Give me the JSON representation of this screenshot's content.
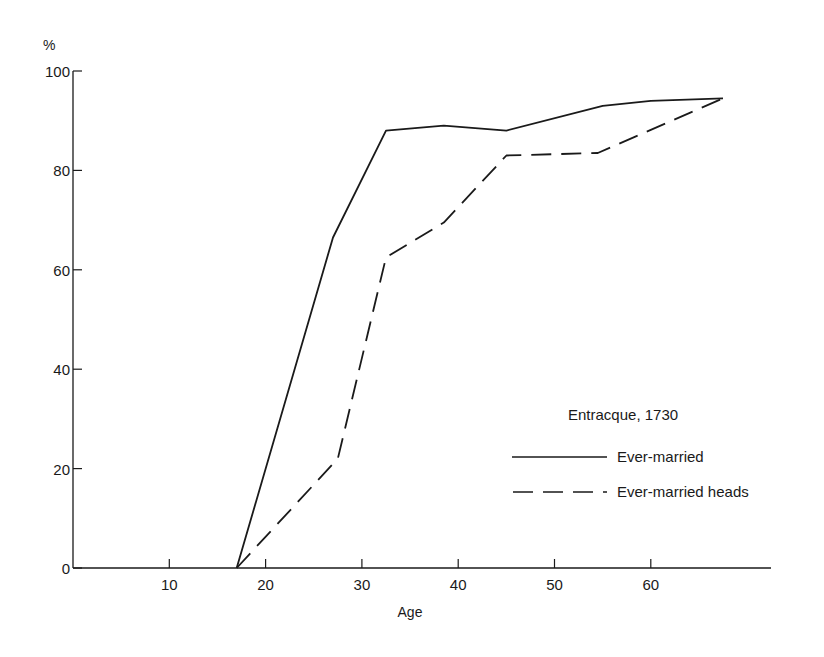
{
  "chart_data": {
    "type": "line",
    "title": "",
    "xlabel": "Age",
    "ylabel": "%",
    "xlim": [
      0,
      73
    ],
    "ylim": [
      0,
      100
    ],
    "x_ticks": [
      10,
      20,
      30,
      40,
      50,
      60
    ],
    "y_ticks": [
      0,
      20,
      40,
      60,
      80,
      100
    ],
    "grid": false,
    "legend": {
      "title": "Entracque, 1730",
      "position": "lower right",
      "entries": [
        "Ever-married",
        "Ever-married heads"
      ]
    },
    "series": [
      {
        "name": "Ever-married",
        "style": "solid",
        "x": [
          17,
          27,
          32.5,
          38.5,
          45,
          55,
          60,
          67.5
        ],
        "y": [
          0,
          66.5,
          88,
          89,
          88,
          93,
          94,
          94.5
        ]
      },
      {
        "name": "Ever-married heads",
        "style": "dashed",
        "x": [
          17,
          27.5,
          32.5,
          38.5,
          45,
          54.5,
          67.5
        ],
        "y": [
          0,
          22,
          62.5,
          69.5,
          83,
          83.5,
          94.5
        ]
      }
    ]
  },
  "labels": {
    "y_unit": "%",
    "x_axis_title": "Age",
    "legend_title": "Entracque, 1730",
    "legend_series_0": "Ever-married",
    "legend_series_1": "Ever-married heads"
  }
}
